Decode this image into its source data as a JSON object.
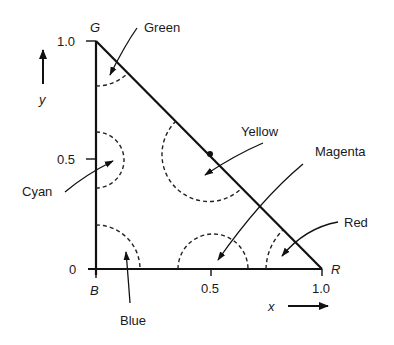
{
  "diagram": {
    "vertices": {
      "G": {
        "label": "G",
        "x": 0,
        "y": 1.0
      },
      "B": {
        "label": "B",
        "x": 0,
        "y": 0
      },
      "R": {
        "label": "R",
        "x": 1.0,
        "y": 0
      }
    },
    "axes": {
      "x": {
        "label": "x",
        "ticks": [
          "0.5",
          "1.0"
        ]
      },
      "y": {
        "label": "y",
        "ticks": [
          "0",
          "0.5",
          "1.0"
        ]
      }
    },
    "regions": [
      {
        "name": "Green",
        "location": "near G vertex"
      },
      {
        "name": "Yellow",
        "location": "midpoint of hypotenuse (0.5, 0.5)"
      },
      {
        "name": "Magenta",
        "location": "midpoint of x-axis (0.5, 0)"
      },
      {
        "name": "Red",
        "location": "near R vertex"
      },
      {
        "name": "Cyan",
        "location": "midpoint of y-axis (0, 0.5)"
      },
      {
        "name": "Blue",
        "location": "near B vertex"
      }
    ],
    "labels": {
      "green": "Green",
      "yellow": "Yellow",
      "magenta": "Magenta",
      "red": "Red",
      "cyan": "Cyan",
      "blue": "Blue",
      "vertex_g": "G",
      "vertex_b": "B",
      "vertex_r": "R",
      "x_axis": "x",
      "y_axis": "y",
      "y_tick_1": "1.0",
      "y_tick_05": "0.5",
      "y_tick_0": "0",
      "x_tick_05": "0.5",
      "x_tick_1": "1.0"
    }
  }
}
